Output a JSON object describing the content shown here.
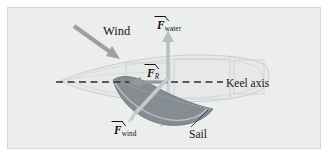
{
  "figure": {
    "background_color": "#eceded",
    "panel_border_color": "#d6d8d8"
  },
  "labels": {
    "wind": "Wind",
    "keel_axis": "Keel axis",
    "sail": "Sail"
  },
  "vectors": {
    "f_water": {
      "symbol": "F",
      "subscript": "water",
      "color": "#b9bcbd",
      "direction": "up"
    },
    "f_r": {
      "symbol": "F",
      "subscript": "R",
      "subscript_italic": true,
      "color": "#8f9294",
      "direction": "left"
    },
    "f_wind": {
      "symbol": "F",
      "subscript": "wind",
      "color": "#c3c6c7",
      "direction": "down-left"
    }
  },
  "elements": {
    "wind_arrow": {
      "name": "wind-arrow",
      "color": "#9fa2a4",
      "direction": "down-right"
    },
    "keel_axis_line": {
      "name": "keel-axis-dashed-line",
      "style": "dashed",
      "color": "#2b2d30"
    },
    "hull": {
      "name": "boat-hull",
      "fill": "#e4e6e6",
      "stroke": "#c9cccd"
    },
    "sail_shape": {
      "name": "sail-shape",
      "fill": "#80878d",
      "stroke": "#6d7479"
    },
    "mast": {
      "name": "mast",
      "color": "#c9cccd"
    },
    "sail_leader_line": {
      "name": "sail-leader-line",
      "color": "#3a3c3f"
    }
  }
}
